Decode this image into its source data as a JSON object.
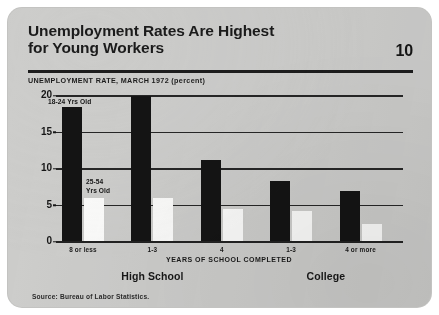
{
  "card": {
    "page_number": "10",
    "title_line1": "Unemployment Rates Are Highest",
    "title_line2": "for Young  Workers",
    "source": "Source:  Bureau of Labor Statistics."
  },
  "chart_data": {
    "type": "bar",
    "title": "Unemployment Rates Are Highest for Young Workers",
    "subtitle": "UNEMPLOYMENT RATE, MARCH 1972 (percent)",
    "xlabel": "YEARS OF SCHOOL COMPLETED",
    "ylabel": "",
    "ylim": [
      0,
      20
    ],
    "yticks": [
      0,
      5,
      10,
      15,
      20
    ],
    "ytick_labels": [
      "0",
      "5",
      "10",
      "15",
      "20"
    ],
    "grid": true,
    "legend_position": "in-plot-annotation",
    "categories": [
      "8 or less",
      "1-3",
      "4",
      "1-3",
      "4 or more"
    ],
    "groups": [
      {
        "name": "High School",
        "categories": [
          "8 or less",
          "1-3",
          "4"
        ]
      },
      {
        "name": "College",
        "categories": [
          "1-3",
          "4 or more"
        ]
      }
    ],
    "series": [
      {
        "name": "18-24 Yrs Old",
        "color": "#141414",
        "values": [
          18.5,
          20.0,
          11.2,
          8.3,
          7.0
        ]
      },
      {
        "name": "25-54 Yrs Old",
        "color": "#fbfbfa",
        "values": [
          6.0,
          6.0,
          4.5,
          4.2,
          2.5
        ]
      }
    ],
    "annotations": [
      {
        "text": "18-24 Yrs Old",
        "series": "18-24 Yrs Old"
      },
      {
        "text_line1": "25-54",
        "text_line2": "Yrs Old",
        "series": "25-54 Yrs Old"
      }
    ],
    "source": "Source:  Bureau of Labor Statistics."
  }
}
